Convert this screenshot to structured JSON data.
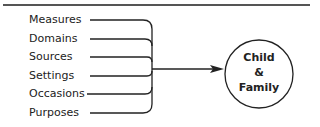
{
  "diagram": {
    "inputs": [
      {
        "label": "Measures",
        "y": 20
      },
      {
        "label": "Domains",
        "y": 39
      },
      {
        "label": "Sources",
        "y": 57
      },
      {
        "label": "Settings",
        "y": 76
      },
      {
        "label": "Occasions",
        "y": 94
      },
      {
        "label": "Purposes",
        "y": 113
      }
    ],
    "target": {
      "line1": "Child",
      "line2": "&",
      "line3": "Family"
    },
    "colors": {
      "stroke": "#222222",
      "rule": "#555555"
    }
  }
}
